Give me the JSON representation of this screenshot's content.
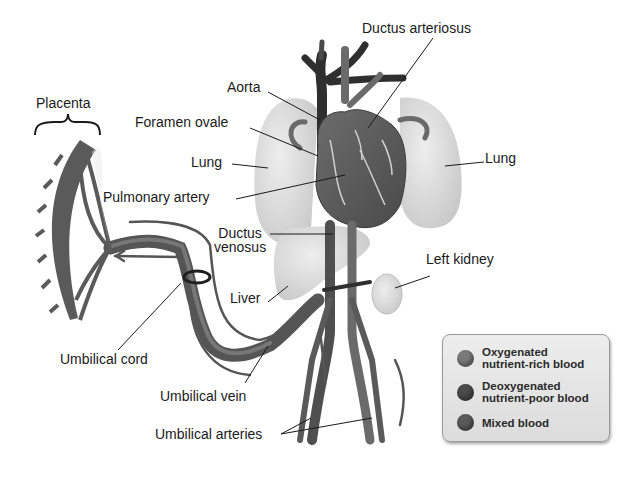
{
  "figure": {
    "labels": {
      "placenta": "Placenta",
      "ductus_arteriosus": "Ductus arteriosus",
      "aorta": "Aorta",
      "foramen_ovale": "Foramen ovale",
      "lung_left": "Lung",
      "lung_right": "Lung",
      "pulmonary_artery": "Pulmonary artery",
      "ductus_venosus_line1": "Ductus",
      "ductus_venosus_line2": "venosus",
      "left_kidney": "Left kidney",
      "liver": "Liver",
      "umbilical_cord": "Umbilical cord",
      "umbilical_vein": "Umbilical vein",
      "umbilical_arteries": "Umbilical arteries"
    }
  },
  "legend": {
    "items": [
      {
        "line1": "Oxygenated",
        "line2": "nutrient-rich blood",
        "color": "#7a7a7a"
      },
      {
        "line1": "Deoxygenated",
        "line2": "nutrient-poor blood",
        "color": "#4a4a4a"
      },
      {
        "line1": "Mixed blood",
        "line2": "",
        "color": "#5a5a5a"
      }
    ]
  },
  "colors": {
    "organ": "#d9d9d9",
    "vessel_mixed": "#5f5f5f",
    "vessel_dark": "#2f2f2f",
    "vessel_light": "#7a7a7a",
    "text": "#1a1a1a"
  }
}
